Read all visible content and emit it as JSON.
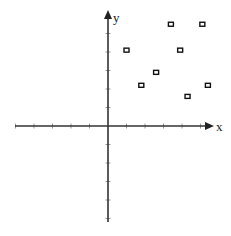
{
  "diagram": {
    "type": "coordinate-plane-scatter",
    "x_axis_label": "x",
    "y_axis_label": "y",
    "origin_px": [
      108,
      126
    ],
    "unit_px": 18.5,
    "x_ticks": [
      -5,
      -4,
      -3,
      -2,
      -1,
      1,
      2,
      3,
      4,
      5
    ],
    "y_ticks": [
      -5,
      -4,
      -3,
      -2,
      -1,
      1,
      2,
      3,
      4,
      5
    ],
    "x_range": [
      -5,
      5
    ],
    "y_range": [
      -5,
      5
    ],
    "axis_color": "#333333",
    "tick_color": "#9a9a9a",
    "point_color": "#111111",
    "point_marker": "small-square-outline",
    "points": [
      {
        "x": 1.0,
        "y": 4.1
      },
      {
        "x": 1.8,
        "y": 2.2
      },
      {
        "x": 2.6,
        "y": 2.9
      },
      {
        "x": 3.4,
        "y": 5.5
      },
      {
        "x": 3.9,
        "y": 4.1
      },
      {
        "x": 4.3,
        "y": 1.6
      },
      {
        "x": 5.1,
        "y": 5.5
      },
      {
        "x": 5.4,
        "y": 2.2
      }
    ]
  },
  "chart_data": {
    "type": "scatter",
    "title": "",
    "xlabel": "x",
    "ylabel": "y",
    "xlim": [
      -5,
      5
    ],
    "ylim": [
      -5,
      5
    ],
    "grid": false,
    "series": [
      {
        "name": "points",
        "x": [
          1.0,
          1.8,
          2.6,
          3.4,
          3.9,
          4.3,
          5.1,
          5.4
        ],
        "y": [
          4.1,
          2.2,
          2.9,
          5.5,
          4.1,
          1.6,
          5.5,
          2.2
        ]
      }
    ]
  }
}
